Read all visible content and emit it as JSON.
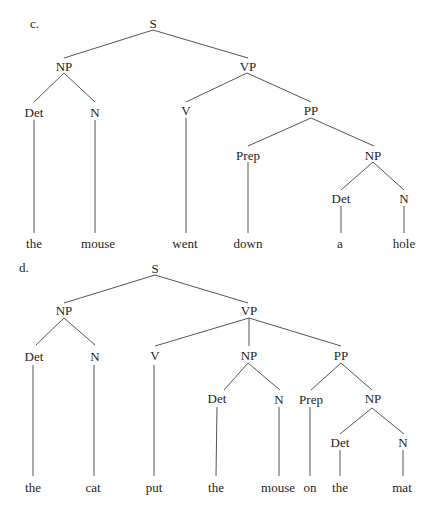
{
  "trees": [
    {
      "label": "c.",
      "sentence": "the mouse went down a hole",
      "nodes": {
        "S": "S",
        "NP": "NP",
        "VP": "VP",
        "Det1": "Det",
        "N1": "N",
        "V": "V",
        "PP": "PP",
        "Prep": "Prep",
        "NP2": "NP",
        "Det2": "Det",
        "N2": "N"
      },
      "leaves": [
        "the",
        "mouse",
        "went",
        "down",
        "a",
        "hole"
      ]
    },
    {
      "label": "d.",
      "sentence": "the cat put the mouse on the mat",
      "nodes": {
        "S": "S",
        "NP": "NP",
        "VP": "VP",
        "Det1": "Det",
        "N1": "N",
        "V": "V",
        "NP2": "NP",
        "PP": "PP",
        "Det2": "Det",
        "N2": "N",
        "Prep": "Prep",
        "NP3": "NP",
        "Det3": "Det",
        "N3": "N"
      },
      "leaves": [
        "the",
        "cat",
        "put",
        "the",
        "mouse",
        "on",
        "the",
        "mat"
      ]
    }
  ],
  "colors": {
    "line": "#555555",
    "text": "#1e1e1e"
  }
}
